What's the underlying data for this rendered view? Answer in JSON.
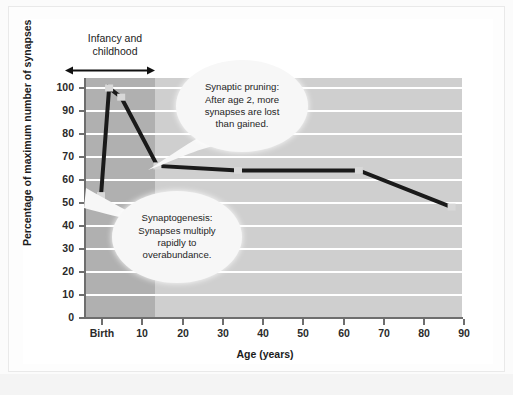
{
  "chart_data": {
    "type": "line",
    "title": "",
    "xlabel": "Age (years)",
    "ylabel": "Percentage of maximum number of synapses",
    "xlim": [
      0,
      95
    ],
    "ylim": [
      0,
      105
    ],
    "grid": true,
    "legend": "none",
    "x_tick_labels": [
      "Birth",
      "10",
      "20",
      "30",
      "40",
      "50",
      "60",
      "70",
      "80",
      "90"
    ],
    "x_tick_values": [
      0,
      10,
      20,
      30,
      40,
      50,
      60,
      70,
      80,
      90
    ],
    "y_tick_labels": [
      "0",
      "10",
      "20",
      "30",
      "40",
      "50",
      "60",
      "70",
      "80",
      "90",
      "100"
    ],
    "y_tick_values": [
      0,
      10,
      20,
      30,
      40,
      50,
      60,
      70,
      80,
      90,
      100
    ],
    "series": [
      {
        "name": "Percentage of maximum number of synapses",
        "x": [
          0,
          2,
          5,
          14,
          34,
          64,
          87
        ],
        "values": [
          53,
          100,
          96,
          66,
          64,
          64,
          48
        ]
      }
    ],
    "shaded_region": {
      "label": "Infancy and childhood",
      "x_start": 0,
      "x_end": 13
    },
    "annotations": [
      {
        "id": "synaptic-pruning",
        "lines": [
          "Synaptic pruning:",
          "After age 2, more",
          "synapses are lost",
          "than gained."
        ],
        "points_to_x": 14,
        "points_to_y": 66
      },
      {
        "id": "synaptogenesis",
        "lines": [
          "Synaptogenesis:",
          "Synapses multiply",
          "rapidly to",
          "overabundance."
        ],
        "points_to_x": 0,
        "points_to_y": 53
      }
    ]
  },
  "chart": {
    "x_axis_title": "Age (years)",
    "y_axis_title": "Percentage of maximum number of synapses",
    "region_label_line1": "Infancy and",
    "region_label_line2": "childhood",
    "x_ticks": [
      "Birth",
      "10",
      "20",
      "30",
      "40",
      "50",
      "60",
      "70",
      "80",
      "90"
    ],
    "y_ticks": [
      "100",
      "90",
      "80",
      "70",
      "60",
      "50",
      "40",
      "30",
      "20",
      "10",
      "0"
    ],
    "callouts": {
      "pruning": {
        "line1": "Synaptic pruning:",
        "line2": "After age 2, more",
        "line3": "synapses are lost",
        "line4": "than gained."
      },
      "synaptogenesis": {
        "line1": "Synaptogenesis:",
        "line2": "Synapses multiply",
        "line3": "rapidly to",
        "line4": "overabundance."
      }
    },
    "colors": {
      "line": "#1a1a1a",
      "marker": "#d8d8d8",
      "plot_background": "#cfcfcf",
      "shaded_band": "#b0b0b0",
      "gridline": "#ffffff",
      "axis": "#6e6e6e",
      "text": "#1c1c1c",
      "callout_background": "#f7f7f7"
    }
  }
}
